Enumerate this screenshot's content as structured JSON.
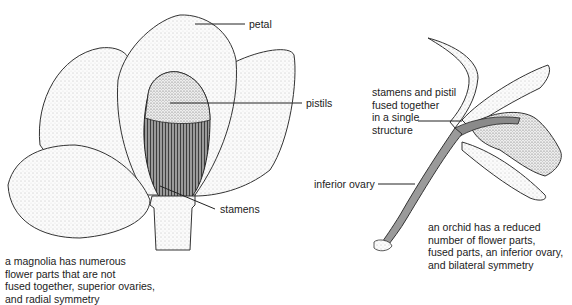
{
  "magnolia": {
    "labels": {
      "petal": "petal",
      "pistils": "pistils",
      "stamens": "stamens"
    },
    "caption": [
      "a magnolia has numerous",
      "flower parts that are not",
      "fused together, superior ovaries,",
      "and radial symmetry"
    ]
  },
  "orchid": {
    "labels": {
      "fused_structure": [
        "stamens and pistil",
        "fused together",
        "in a single",
        "structure"
      ],
      "inferior_ovary": "inferior ovary"
    },
    "caption": [
      "an orchid has a reduced",
      "number of flower parts,",
      "fused parts, an inferior ovary,",
      "and bilateral symmetry"
    ]
  }
}
